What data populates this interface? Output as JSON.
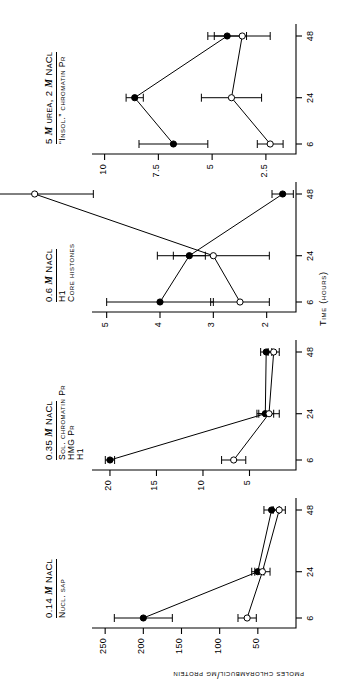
{
  "figure": {
    "xlabel": "Time (hours)",
    "ylabel": "pmoles chlorambucil/mg protein",
    "x_ticks": [
      "6",
      "24",
      "48"
    ],
    "x_values": [
      6,
      24,
      48
    ]
  },
  "legend": {
    "filled_marker": "filled-circle",
    "open_marker": "open-circle"
  },
  "panels": [
    {
      "id": "panel-nucl-sap",
      "title": "0.14 M NaCl",
      "title_prefix": "0.14",
      "title_italic": "M",
      "title_suffix": "NaCl",
      "subtitle": "Nucl. sap",
      "y_ticks": [
        "250",
        "200",
        "150",
        "100",
        "50"
      ],
      "y_values": [
        250,
        200,
        150,
        100,
        50
      ],
      "ylim": [
        0,
        262
      ]
    },
    {
      "id": "panel-sol-chromatin",
      "title": "0.35 M NaCl",
      "title_prefix": "0.35",
      "title_italic": "M",
      "title_suffix": "NaCl",
      "subtitle": "Sol. chromatin Pr\nHMG Pr\nH1",
      "subtitle_lines": [
        "Sol. chromatin Pr",
        "HMG Pr",
        "H1"
      ],
      "y_ticks": [
        "20",
        "15",
        "10",
        "5"
      ],
      "y_values": [
        20,
        15,
        10,
        5
      ],
      "ylim": [
        0,
        21.5
      ]
    },
    {
      "id": "panel-core-histones",
      "title": "0.6 M NaCl",
      "title_prefix": "0.6",
      "title_italic": "M",
      "title_suffix": "NaCl",
      "subtitle": "H1\nCore histones",
      "subtitle_lines": [
        "H1",
        "Core histones"
      ],
      "y_ticks": [
        "5",
        "4",
        "3",
        "2"
      ],
      "y_values": [
        5,
        4,
        3,
        2
      ],
      "ylim": [
        1.45,
        5.2
      ]
    },
    {
      "id": "panel-insol-chromatin",
      "title": "5 M urea, 2 M NaCl",
      "title_prefix": "5",
      "title_italic": "M",
      "title_mid": "urea, 2",
      "title_italic2": "M",
      "title_suffix": "NaCl",
      "subtitle": "“Insol.” chromatin Pr",
      "y_ticks": [
        "10",
        "7.5",
        "5",
        "2.5"
      ],
      "y_values": [
        10,
        7.5,
        5,
        2.5
      ],
      "ylim": [
        1.1,
        10.4
      ]
    }
  ],
  "chart_data": {
    "type": "line",
    "title": "",
    "xlabel": "Time (hours)",
    "ylabel": "pmoles chlorambucil/mg protein",
    "x": [
      6,
      24,
      48
    ],
    "grid": false,
    "legend_position": "none",
    "panels": [
      {
        "name": "0.14 M NaCl — Nucl. sap",
        "ylim": [
          0,
          262
        ],
        "yticks": [
          50,
          100,
          150,
          200,
          250
        ],
        "series": [
          {
            "name": "filled-circle",
            "values": [
              200,
              50,
              32
            ],
            "errors": [
              38,
              8,
              10
            ]
          },
          {
            "name": "open-circle",
            "values": [
              64,
              44,
              22
            ],
            "errors": [
              12,
              10,
              8
            ]
          }
        ]
      },
      {
        "name": "0.35 M NaCl — Sol. chromatin Pr / HMG Pr / H1",
        "ylim": [
          0,
          21.5
        ],
        "yticks": [
          5,
          10,
          15,
          20
        ],
        "series": [
          {
            "name": "filled-circle",
            "values": [
              20.0,
              3.3,
              3.2
            ],
            "errors": [
              0.5,
              0.9,
              0.6
            ]
          },
          {
            "name": "open-circle",
            "values": [
              6.7,
              2.9,
              2.4
            ],
            "errors": [
              1.3,
              1.1,
              0.6
            ]
          }
        ]
      },
      {
        "name": "0.6 M NaCl — H1 / Core histones",
        "ylim": [
          1.45,
          5.2
        ],
        "yticks": [
          2,
          3,
          4,
          5
        ],
        "series": [
          {
            "name": "filled-circle",
            "values": [
              4.0,
              3.45,
              1.7
            ],
            "errors": [
              1.0,
              0.3,
              0.2
            ]
          },
          {
            "name": "open-circle",
            "values": [
              2.5,
              3.0,
              6.35
            ],
            "errors": [
              0.55,
              1.05,
              1.1
            ]
          }
        ]
      },
      {
        "name": "5 M urea, 2 M NaCl — “Insol.” chromatin Pr",
        "ylim": [
          1.1,
          10.4
        ],
        "yticks": [
          2.5,
          5,
          7.5,
          10
        ],
        "series": [
          {
            "name": "filled-circle",
            "values": [
              6.8,
              8.6,
              4.3
            ],
            "errors": [
              1.6,
              0.4,
              0.9
            ]
          },
          {
            "name": "open-circle",
            "values": [
              2.3,
              4.1,
              3.6
            ],
            "errors": [
              0.6,
              1.4,
              1.3
            ]
          }
        ]
      }
    ]
  }
}
